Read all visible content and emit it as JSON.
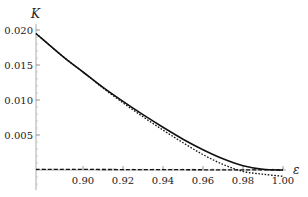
{
  "chart_data": {
    "type": "line",
    "title": "",
    "xlabel": "ε",
    "ylabel": "K",
    "xlim": [
      0.8765,
      1.0
    ],
    "ylim": [
      -0.0012,
      0.0205
    ],
    "grid": false,
    "legend": null,
    "x_ticks": [
      0.9,
      0.92,
      0.94,
      0.96,
      0.98,
      1.0
    ],
    "x_tick_labels": [
      "0.90",
      "0.92",
      "0.94",
      "0.96",
      "0.98",
      "1.00"
    ],
    "y_ticks": [
      0.005,
      0.01,
      0.015,
      0.02
    ],
    "y_tick_labels": [
      "0.005",
      "0.010",
      "0.015",
      "0.020"
    ],
    "series": [
      {
        "name": "solid",
        "style": "solid",
        "x": [
          0.8765,
          0.89,
          0.9,
          0.91,
          0.92,
          0.93,
          0.94,
          0.95,
          0.96,
          0.97,
          0.98,
          0.99,
          1.0
        ],
        "values": [
          0.0195,
          0.0162,
          0.014,
          0.0118,
          0.0098,
          0.0079,
          0.0061,
          0.0044,
          0.0029,
          0.0016,
          0.0006,
          0.0001,
          0.0
        ]
      },
      {
        "name": "dotted",
        "style": "dotted",
        "x": [
          0.8765,
          0.89,
          0.9,
          0.91,
          0.92,
          0.93,
          0.94,
          0.95,
          0.96,
          0.97,
          0.98,
          0.99,
          1.0
        ],
        "values": [
          0.0195,
          0.0162,
          0.014,
          0.0117,
          0.0096,
          0.0076,
          0.0057,
          0.0039,
          0.0022,
          0.0008,
          -0.0002,
          -0.0006,
          -0.0009
        ]
      },
      {
        "name": "dashed",
        "style": "dashed",
        "x": [
          0.8765,
          1.0
        ],
        "values": [
          0.0001,
          0.0
        ]
      }
    ]
  }
}
